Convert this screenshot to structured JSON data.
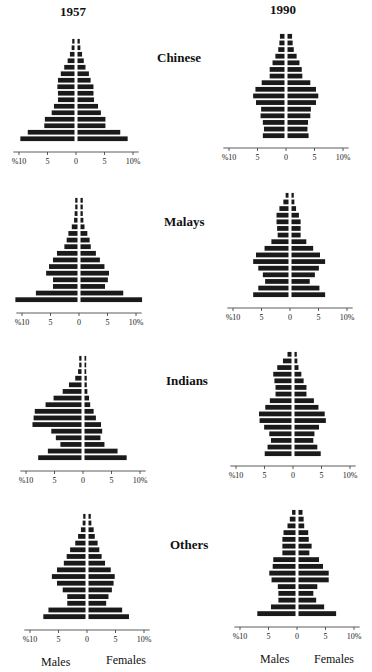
{
  "headers": {
    "left_year": "1957",
    "right_year": "1990"
  },
  "footer": {
    "males_label": "Males",
    "females_label": "Females"
  },
  "axis": {
    "tick_labels": [
      "%10",
      "5",
      "0",
      "5",
      "10%"
    ]
  },
  "chart_data": {
    "type": "bar",
    "subtype": "population-pyramid",
    "title": "",
    "xlabel": "Percent of population",
    "ylabel": "Age group (youngest at bottom)",
    "xlim": [
      -10,
      10
    ],
    "tick_labels": [
      "%10",
      "5",
      "0",
      "5",
      "10%"
    ],
    "legend": [
      "Males",
      "Females"
    ],
    "age_groups_bottom_to_top": 16,
    "panels": [
      {
        "group": "Chinese",
        "year": "1957",
        "males": [
          9.5,
          8.2,
          5.3,
          5.2,
          4.0,
          3.6,
          2.9,
          2.9,
          3.0,
          2.9,
          2.4,
          1.8,
          1.2,
          0.8,
          0.5,
          0.4
        ],
        "females": [
          8.8,
          7.5,
          4.9,
          4.9,
          4.1,
          3.6,
          2.9,
          2.8,
          2.8,
          2.3,
          2.0,
          1.4,
          1.1,
          0.8,
          0.5,
          0.4
        ]
      },
      {
        "group": "Chinese",
        "year": "1990",
        "males": [
          3.8,
          3.6,
          3.8,
          4.2,
          4.1,
          5.0,
          5.5,
          5.1,
          4.0,
          2.6,
          2.6,
          2.1,
          1.6,
          1.1,
          0.9,
          0.8
        ],
        "females": [
          3.7,
          3.5,
          3.6,
          4.0,
          4.1,
          5.0,
          5.4,
          5.0,
          4.0,
          2.6,
          2.5,
          2.1,
          1.6,
          1.1,
          0.9,
          0.8
        ]
      },
      {
        "group": "Malays",
        "year": "1957",
        "males": [
          10.9,
          7.3,
          4.3,
          4.3,
          5.5,
          5.0,
          4.3,
          3.6,
          2.3,
          1.9,
          1.6,
          1.0,
          0.6,
          0.5,
          0.4,
          0.4
        ],
        "females": [
          10.8,
          7.5,
          4.3,
          4.8,
          5.0,
          4.2,
          3.4,
          2.7,
          1.8,
          1.6,
          1.2,
          0.7,
          0.5,
          0.4,
          0.4,
          0.4
        ]
      },
      {
        "group": "Malays",
        "year": "1990",
        "males": [
          6.2,
          5.3,
          4.1,
          4.5,
          5.3,
          6.2,
          5.7,
          4.2,
          3.0,
          1.9,
          2.0,
          2.1,
          2.1,
          1.6,
          0.9,
          0.5
        ],
        "females": [
          5.9,
          4.9,
          3.2,
          4.1,
          4.8,
          5.9,
          5.0,
          3.8,
          2.6,
          1.6,
          1.6,
          1.6,
          1.3,
          0.8,
          0.5,
          0.4
        ]
      },
      {
        "group": "Indians",
        "year": "1957",
        "males": [
          7.6,
          5.9,
          3.7,
          4.5,
          5.3,
          8.6,
          8.4,
          8.2,
          6.3,
          4.9,
          3.3,
          2.2,
          1.1,
          0.6,
          0.4,
          0.4
        ],
        "females": [
          7.4,
          5.8,
          3.5,
          2.8,
          3.1,
          2.9,
          2.0,
          1.6,
          1.0,
          0.8,
          0.5,
          0.4,
          0.4,
          0.3,
          0.3,
          0.3
        ]
      },
      {
        "group": "Indians",
        "year": "1990",
        "males": [
          4.7,
          4.2,
          3.6,
          3.9,
          4.8,
          5.6,
          5.7,
          4.6,
          3.8,
          2.8,
          2.8,
          3.0,
          3.2,
          2.5,
          1.5,
          0.7
        ],
        "females": [
          4.6,
          4.0,
          3.3,
          3.5,
          4.3,
          5.5,
          5.3,
          4.2,
          3.4,
          2.1,
          2.1,
          1.6,
          1.2,
          0.7,
          0.5,
          0.4
        ]
      },
      {
        "group": "Others",
        "year": "1957",
        "males": [
          7.4,
          6.5,
          3.2,
          3.2,
          4.0,
          5.0,
          5.9,
          5.0,
          3.8,
          3.3,
          2.7,
          1.8,
          1.3,
          0.8,
          0.5,
          0.4
        ],
        "females": [
          7.1,
          5.9,
          3.1,
          3.5,
          4.1,
          4.4,
          4.6,
          3.9,
          2.9,
          2.3,
          1.9,
          1.6,
          1.1,
          0.9,
          0.5,
          0.4
        ]
      },
      {
        "group": "Others",
        "year": "1990",
        "males": [
          6.7,
          4.3,
          3.0,
          3.0,
          3.1,
          4.2,
          4.6,
          4.0,
          3.9,
          2.3,
          2.3,
          2.3,
          2.1,
          1.4,
          1.0,
          0.6
        ],
        "females": [
          6.6,
          4.5,
          3.1,
          2.6,
          3.3,
          5.3,
          5.3,
          4.3,
          3.6,
          1.9,
          2.3,
          1.8,
          1.7,
          1.0,
          0.9,
          0.7
        ]
      }
    ]
  },
  "layout_groups": [
    "Chinese",
    "Malays",
    "Indians",
    "Others"
  ]
}
